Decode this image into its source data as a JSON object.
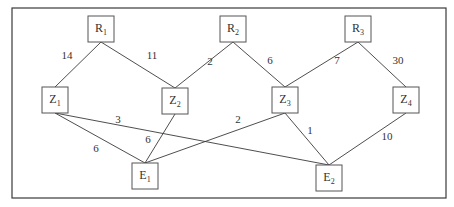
{
  "diagram": {
    "nodes": [
      {
        "id": "R1",
        "letter": "R",
        "sub": "1",
        "layer": "top"
      },
      {
        "id": "R2",
        "letter": "R",
        "sub": "2",
        "layer": "top"
      },
      {
        "id": "R3",
        "letter": "R",
        "sub": "3",
        "layer": "top"
      },
      {
        "id": "Z1",
        "letter": "Z",
        "sub": "1",
        "layer": "middle"
      },
      {
        "id": "Z2",
        "letter": "Z",
        "sub": "2",
        "layer": "middle"
      },
      {
        "id": "Z3",
        "letter": "Z",
        "sub": "3",
        "layer": "middle"
      },
      {
        "id": "Z4",
        "letter": "Z",
        "sub": "4",
        "layer": "middle"
      },
      {
        "id": "E1",
        "letter": "E",
        "sub": "1",
        "layer": "bottom"
      },
      {
        "id": "E2",
        "letter": "E",
        "sub": "2",
        "layer": "bottom"
      }
    ],
    "edges": [
      {
        "from": "R1",
        "to": "Z1",
        "weight": "14"
      },
      {
        "from": "R1",
        "to": "Z2",
        "weight": "11"
      },
      {
        "from": "R2",
        "to": "Z2",
        "weight": "2"
      },
      {
        "from": "R2",
        "to": "Z3",
        "weight": "6"
      },
      {
        "from": "R3",
        "to": "Z3",
        "weight": "7"
      },
      {
        "from": "R3",
        "to": "Z4",
        "weight": "30"
      },
      {
        "from": "Z1",
        "to": "E1",
        "weight": "6"
      },
      {
        "from": "Z1",
        "to": "E2",
        "weight": "3"
      },
      {
        "from": "Z2",
        "to": "E1",
        "weight": "6"
      },
      {
        "from": "Z3",
        "to": "E1",
        "weight": "2"
      },
      {
        "from": "Z3",
        "to": "E2",
        "weight": "1"
      },
      {
        "from": "Z4",
        "to": "E2",
        "weight": "10"
      }
    ]
  }
}
